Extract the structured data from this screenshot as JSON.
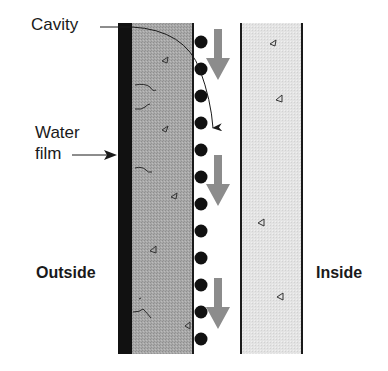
{
  "diagram": {
    "labels": {
      "cavity": "Cavity",
      "water_film_line1": "Water",
      "water_film_line2": "film",
      "outside": "Outside",
      "inside": "Inside"
    },
    "elements": {
      "outer_cladding": "exterior wall layer (dark water-resistive barrier + stippled masonry/brick veneer)",
      "cavity_drainage": "air cavity with drainage spacers (12 dots) and 3 downward water-flow arrows",
      "inner_wall": "interior wall layer (light stippled backup wall)",
      "curved_arrow": "water path across cavity from outer layer down the drainage plane"
    },
    "counts": {
      "spacer_dots": 12,
      "flow_arrows": 3
    },
    "colors": {
      "barrier": "#111111",
      "outer_fill": "#a6a6a6",
      "inner_fill": "#e2e2e2",
      "flow_arrow": "#8c8c8c",
      "ink": "#1a1a1a"
    }
  }
}
